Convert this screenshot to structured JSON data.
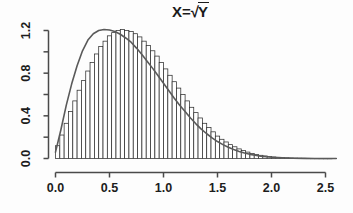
{
  "figure": {
    "title_prefix": "X=",
    "title_radical": "√",
    "title_radicand": "Y",
    "title_full": "X=√Y",
    "background_color": "#fdfdfd",
    "axis_color": "#4a4a4a",
    "bar_fill_color": "#ffffff",
    "bar_stroke_color": "#2e2e2e",
    "curve_color": "#5a5a5a"
  },
  "axes": {
    "x": {
      "tick_labels": [
        "0.0",
        "0.5",
        "1.0",
        "1.5",
        "2.0",
        "2.5"
      ],
      "tick_values": [
        0.0,
        0.5,
        1.0,
        1.5,
        2.0,
        2.5
      ],
      "range": [
        0.0,
        2.6
      ],
      "label": ""
    },
    "y": {
      "tick_labels": [
        "0.0",
        "0.4",
        "0.8",
        "1.2"
      ],
      "tick_values": [
        0.0,
        0.4,
        0.8,
        1.2
      ],
      "minor_tick_values": [
        0.2,
        0.6,
        1.0
      ],
      "range": [
        0.0,
        1.26
      ],
      "label": ""
    }
  },
  "chart_data": {
    "type": "bar",
    "title": "X=√Y",
    "xlabel": "",
    "ylabel": "",
    "xlim": [
      0.0,
      2.6
    ],
    "ylim": [
      0.0,
      1.26
    ],
    "grid": false,
    "legend": "none",
    "bin_width": 0.04,
    "categories": [
      "0.00",
      "0.04",
      "0.08",
      "0.12",
      "0.16",
      "0.20",
      "0.24",
      "0.28",
      "0.32",
      "0.36",
      "0.40",
      "0.44",
      "0.48",
      "0.52",
      "0.56",
      "0.60",
      "0.64",
      "0.68",
      "0.72",
      "0.76",
      "0.80",
      "0.84",
      "0.88",
      "0.92",
      "0.96",
      "1.00",
      "1.04",
      "1.08",
      "1.12",
      "1.16",
      "1.20",
      "1.24",
      "1.28",
      "1.32",
      "1.36",
      "1.40",
      "1.44",
      "1.48",
      "1.52",
      "1.56",
      "1.60",
      "1.64",
      "1.68",
      "1.72",
      "1.76",
      "1.80",
      "1.84",
      "1.88",
      "1.92",
      "1.96",
      "2.00",
      "2.04",
      "2.08",
      "2.12",
      "2.16",
      "2.20",
      "2.24",
      "2.28",
      "2.32",
      "2.36",
      "2.40",
      "2.44",
      "2.48",
      "2.52"
    ],
    "values": [
      0.12,
      0.22,
      0.33,
      0.44,
      0.54,
      0.64,
      0.73,
      0.82,
      0.9,
      0.98,
      1.05,
      1.1,
      1.15,
      1.18,
      1.2,
      1.21,
      1.2,
      1.19,
      1.17,
      1.14,
      1.1,
      1.06,
      1.01,
      0.96,
      0.9,
      0.84,
      0.78,
      0.72,
      0.66,
      0.6,
      0.54,
      0.48,
      0.43,
      0.38,
      0.33,
      0.29,
      0.25,
      0.21,
      0.18,
      0.155,
      0.13,
      0.11,
      0.09,
      0.074,
      0.06,
      0.048,
      0.038,
      0.03,
      0.024,
      0.018,
      0.014,
      0.011,
      0.008,
      0.006,
      0.0045,
      0.0033,
      0.0024,
      0.0017,
      0.0012,
      0.0008,
      0.0006,
      0.0004,
      0.0003,
      0.0002
    ],
    "series": [
      {
        "name": "density",
        "type": "line",
        "x": [
          0.0,
          0.05,
          0.1,
          0.15,
          0.2,
          0.25,
          0.3,
          0.35,
          0.4,
          0.45,
          0.5,
          0.55,
          0.6,
          0.65,
          0.7,
          0.75,
          0.8,
          0.85,
          0.9,
          0.95,
          1.0,
          1.05,
          1.1,
          1.15,
          1.2,
          1.25,
          1.3,
          1.35,
          1.4,
          1.45,
          1.5,
          1.55,
          1.6,
          1.65,
          1.7,
          1.75,
          1.8,
          1.85,
          1.9,
          1.95,
          2.0,
          2.1,
          2.2,
          2.3,
          2.4,
          2.5,
          2.6
        ],
        "values": [
          0.06,
          0.27,
          0.5,
          0.7,
          0.87,
          1.01,
          1.11,
          1.17,
          1.2,
          1.21,
          1.205,
          1.19,
          1.165,
          1.13,
          1.09,
          1.035,
          0.975,
          0.91,
          0.845,
          0.775,
          0.705,
          0.635,
          0.565,
          0.5,
          0.44,
          0.38,
          0.325,
          0.275,
          0.232,
          0.193,
          0.159,
          0.13,
          0.105,
          0.084,
          0.066,
          0.051,
          0.039,
          0.03,
          0.022,
          0.016,
          0.012,
          0.006,
          0.003,
          0.0013,
          0.0006,
          0.0002,
          0.0001
        ]
      }
    ]
  }
}
